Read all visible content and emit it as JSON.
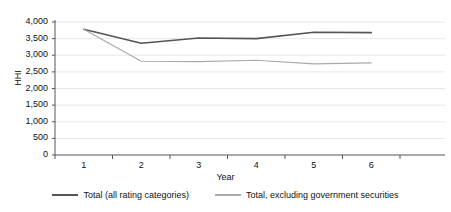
{
  "chart_data": {
    "type": "line",
    "title": "",
    "xlabel": "Year",
    "ylabel": "HHI",
    "x": [
      1,
      2,
      3,
      4,
      5,
      6
    ],
    "xtick_labels": [
      "1",
      "2",
      "3",
      "4",
      "5",
      "6"
    ],
    "ytick_labels": [
      "0",
      "500",
      "1,000",
      "1,500",
      "2,000",
      "2,500",
      "3,000",
      "3,500",
      "4,000"
    ],
    "ytick_values": [
      0,
      500,
      1000,
      1500,
      2000,
      2500,
      3000,
      3500,
      4000
    ],
    "ylim": [
      0,
      4000
    ],
    "xlim": [
      0.5,
      6.5
    ],
    "grid": true,
    "legend_position": "bottom",
    "series": [
      {
        "name": "Total (all rating categories)",
        "color": "#555555",
        "values": [
          3780,
          3360,
          3520,
          3500,
          3690,
          3680
        ]
      },
      {
        "name": "Total, excluding government securities",
        "color": "#aaaaaa",
        "values": [
          3780,
          2820,
          2810,
          2850,
          2740,
          2770
        ]
      }
    ]
  },
  "legend": {
    "items": [
      {
        "label": "Total (all rating categories)",
        "color": "#555555"
      },
      {
        "label": "Total, excluding government securities",
        "color": "#aaaaaa"
      }
    ]
  },
  "colors": {
    "axis": "#555555",
    "grid": "#e8e8e8",
    "text": "#111111",
    "background": "#ffffff"
  }
}
